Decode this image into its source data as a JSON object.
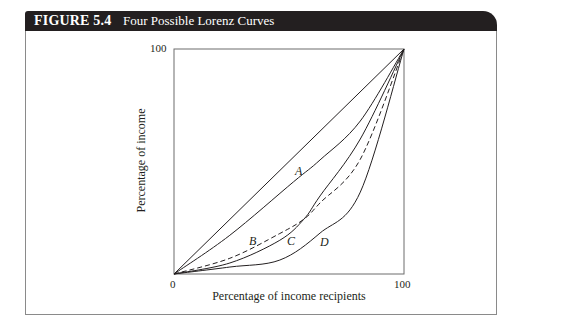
{
  "figure": {
    "number": "FIGURE 5.4",
    "title": "Four Possible Lorenz Curves"
  },
  "chart_data": {
    "type": "line",
    "title": "Four Possible Lorenz Curves",
    "xlabel": "Percentage of income recipients",
    "ylabel": "Percentage of income",
    "xlim": [
      0,
      100
    ],
    "ylim": [
      0,
      100
    ],
    "x_ticks": [
      "0",
      "100"
    ],
    "y_ticks": [
      "100"
    ],
    "grid": false,
    "legend": "none (curves labeled inline A, B, C, D)",
    "series": [
      {
        "name": "Line of perfect equality",
        "style": "solid",
        "x": [
          0,
          100
        ],
        "y": [
          0,
          100
        ]
      },
      {
        "name": "A",
        "style": "solid",
        "x": [
          0,
          24,
          52,
          63.5,
          81,
          100
        ],
        "y": [
          0,
          17,
          41,
          50.7,
          68,
          100
        ]
      },
      {
        "name": "B",
        "style": "dashed",
        "x": [
          0,
          24.3,
          46,
          56.5,
          63.5,
          81,
          100
        ],
        "y": [
          0,
          7,
          18,
          24.4,
          31.6,
          51,
          100
        ]
      },
      {
        "name": "C",
        "style": "solid",
        "x": [
          0,
          24.3,
          46,
          56.5,
          63.5,
          81,
          100
        ],
        "y": [
          0,
          4.9,
          15,
          24.4,
          34.7,
          60,
          100
        ]
      },
      {
        "name": "D",
        "style": "solid",
        "x": [
          0,
          24.3,
          46,
          63.5,
          81,
          100
        ],
        "y": [
          0,
          3.1,
          6.2,
          18.2,
          36.4,
          100
        ]
      }
    ],
    "annotations": [
      {
        "text": "A",
        "x": 54.5,
        "y": 45
      },
      {
        "text": "B",
        "x": 34.5,
        "y": 14
      },
      {
        "text": "C",
        "x": 51,
        "y": 14
      },
      {
        "text": "D",
        "x": 65.5,
        "y": 13
      }
    ]
  },
  "axes": {
    "x_tick_0": "0",
    "x_tick_100": "100",
    "y_tick_100": "100",
    "xlabel": "Percentage of income recipients",
    "ylabel": "Percentage of income"
  },
  "labels": {
    "A": "A",
    "B": "B",
    "C": "C",
    "D": "D"
  },
  "colors": {
    "header_bg": "#231f20",
    "header_text": "#ffffff",
    "line": "#231f20",
    "frame": "#8a8a8a"
  }
}
